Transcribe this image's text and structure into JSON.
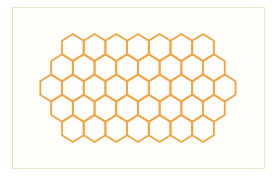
{
  "figure": {
    "colors": {
      "stroke": "#f2a340",
      "frame": "#ece2c6",
      "background": "#ffffff"
    },
    "hexagon": {
      "orientation": "pointy-top",
      "width": 21.7,
      "radius": 13.5,
      "row_step": 20.25
    },
    "rows": [
      {
        "count": 7,
        "start_x": 72.85,
        "y": 47.5
      },
      {
        "count": 8,
        "start_x": 62.0,
        "y": 67.75
      },
      {
        "count": 9,
        "start_x": 51.15,
        "y": 88.0
      },
      {
        "count": 8,
        "start_x": 62.0,
        "y": 108.25
      },
      {
        "count": 7,
        "start_x": 72.85,
        "y": 128.5
      }
    ],
    "total_hexagons": 39
  }
}
